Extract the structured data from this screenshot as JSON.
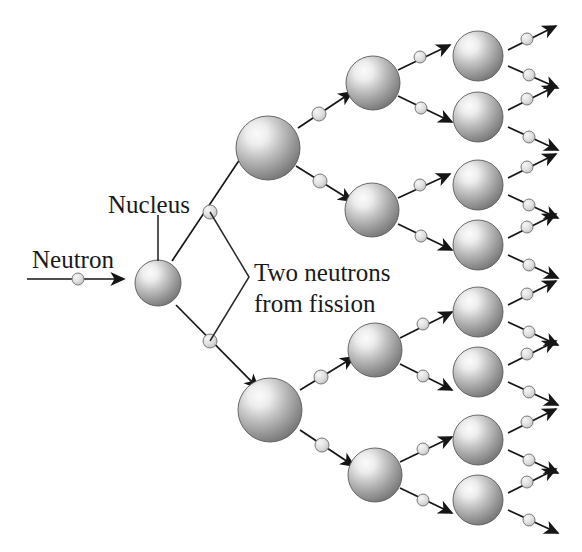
{
  "diagram": {
    "background_color": "#ffffff",
    "width": 582,
    "height": 552,
    "labels": {
      "neutron": "Neutron",
      "nucleus": "Nucleus",
      "two_neutrons_line1": "Two neutrons",
      "two_neutrons_line2": "from fission"
    },
    "colors": {
      "ink": "#1a1a1a",
      "sphere_light": "#f2f2f2",
      "sphere_mid": "#9d9d9d",
      "sphere_dark": "#6b6b6b",
      "sphere_edge": "#5a5a5a",
      "neutron_fill": "#dcdcdc",
      "neutron_stroke": "#7a7a7a",
      "arrow": "#161616",
      "leader_line": "#2a2a2a"
    },
    "generations": [
      {
        "index": 1,
        "name": "initial-nucleus",
        "sphere_radius": 23,
        "nuclei": [
          {
            "cx": 158,
            "cy": 283
          }
        ]
      },
      {
        "index": 2,
        "name": "second-generation",
        "sphere_radius": 32,
        "nuclei": [
          {
            "cx": 268,
            "cy": 148
          },
          {
            "cx": 270,
            "cy": 410
          }
        ]
      },
      {
        "index": 3,
        "name": "third-generation",
        "sphere_radius": 27,
        "nuclei": [
          {
            "cx": 373,
            "cy": 83
          },
          {
            "cx": 372,
            "cy": 210
          },
          {
            "cx": 375,
            "cy": 350
          },
          {
            "cx": 375,
            "cy": 475
          }
        ]
      },
      {
        "index": 4,
        "name": "fourth-generation",
        "sphere_radius": 25,
        "nuclei": [
          {
            "cx": 478,
            "cy": 56
          },
          {
            "cx": 478,
            "cy": 117
          },
          {
            "cx": 478,
            "cy": 185
          },
          {
            "cx": 478,
            "cy": 245
          },
          {
            "cx": 478,
            "cy": 312
          },
          {
            "cx": 478,
            "cy": 372
          },
          {
            "cx": 478,
            "cy": 440
          },
          {
            "cx": 478,
            "cy": 500
          }
        ]
      }
    ],
    "incoming_neutron": {
      "name": "incoming-neutron",
      "x1": 27,
      "y1": 279,
      "x2": 124,
      "y2": 279,
      "neutron_cx": 78,
      "neutron_cy": 279,
      "neutron_r": 6
    },
    "nucleus_leader": {
      "x1": 158,
      "y1": 215,
      "x2": 158,
      "y2": 261
    },
    "neutron_label_pos": {
      "x": 32,
      "y": 268
    },
    "nucleus_label_pos": {
      "x": 108,
      "y": 213
    },
    "two_neutrons_label_pos": {
      "x": 254,
      "y": 281
    },
    "callout_bracket": {
      "apex_x": 249,
      "apex_y": 277,
      "top_x": 210,
      "top_y": 212,
      "bottom_x": 210,
      "bottom_y": 341
    },
    "emitted_neutrons": [
      {
        "from": "gen1",
        "x1": 172,
        "y1": 261,
        "x2": 262,
        "y2": 126,
        "nx": 210,
        "ny": 212,
        "r": 7,
        "arrow": true
      },
      {
        "from": "gen1",
        "x1": 176,
        "y1": 305,
        "x2": 258,
        "y2": 388,
        "nx": 210,
        "ny": 341,
        "r": 7,
        "arrow": true
      },
      {
        "from": "gen2a",
        "x1": 298,
        "y1": 128,
        "x2": 352,
        "y2": 92,
        "nx": 319,
        "ny": 114,
        "r": 7,
        "arrow": true
      },
      {
        "from": "gen2a",
        "x1": 296,
        "y1": 166,
        "x2": 352,
        "y2": 201,
        "nx": 320,
        "ny": 181,
        "r": 7,
        "arrow": true
      },
      {
        "from": "gen2b",
        "x1": 300,
        "y1": 390,
        "x2": 354,
        "y2": 357,
        "nx": 321,
        "ny": 377,
        "r": 7,
        "arrow": true
      },
      {
        "from": "gen2b",
        "x1": 300,
        "y1": 430,
        "x2": 354,
        "y2": 466,
        "nx": 322,
        "ny": 445,
        "r": 7,
        "arrow": true
      },
      {
        "from": "gen3a",
        "x1": 398,
        "y1": 70,
        "x2": 450,
        "y2": 45,
        "nx": 420,
        "ny": 57,
        "r": 6,
        "arrow": true
      },
      {
        "from": "gen3a",
        "x1": 398,
        "y1": 96,
        "x2": 452,
        "y2": 122,
        "nx": 421,
        "ny": 108,
        "r": 6,
        "arrow": true
      },
      {
        "from": "gen3b",
        "x1": 398,
        "y1": 198,
        "x2": 450,
        "y2": 174,
        "nx": 420,
        "ny": 185,
        "r": 6,
        "arrow": true
      },
      {
        "from": "gen3b",
        "x1": 398,
        "y1": 224,
        "x2": 452,
        "y2": 250,
        "nx": 421,
        "ny": 236,
        "r": 6,
        "arrow": true
      },
      {
        "from": "gen3c",
        "x1": 400,
        "y1": 338,
        "x2": 452,
        "y2": 312,
        "nx": 423,
        "ny": 324,
        "r": 6,
        "arrow": true
      },
      {
        "from": "gen3c",
        "x1": 400,
        "y1": 364,
        "x2": 452,
        "y2": 390,
        "nx": 423,
        "ny": 376,
        "r": 6,
        "arrow": true
      },
      {
        "from": "gen3d",
        "x1": 400,
        "y1": 462,
        "x2": 452,
        "y2": 437,
        "nx": 423,
        "ny": 449,
        "r": 6,
        "arrow": true
      },
      {
        "from": "gen3d",
        "x1": 400,
        "y1": 488,
        "x2": 452,
        "y2": 513,
        "nx": 423,
        "ny": 500,
        "r": 6,
        "arrow": true
      },
      {
        "from": "gen4-1",
        "x1": 508,
        "y1": 50,
        "x2": 556,
        "y2": 26,
        "nx": 527,
        "ny": 39,
        "r": 6,
        "arrow": true
      },
      {
        "from": "gen4-1",
        "x1": 508,
        "y1": 66,
        "x2": 558,
        "y2": 88,
        "nx": 529,
        "ny": 75,
        "r": 6,
        "arrow": true
      },
      {
        "from": "gen4-2",
        "x1": 508,
        "y1": 110,
        "x2": 556,
        "y2": 86,
        "nx": 527,
        "ny": 99,
        "r": 6,
        "arrow": true
      },
      {
        "from": "gen4-2",
        "x1": 508,
        "y1": 127,
        "x2": 558,
        "y2": 150,
        "nx": 529,
        "ny": 137,
        "r": 6,
        "arrow": true
      },
      {
        "from": "gen4-3",
        "x1": 508,
        "y1": 178,
        "x2": 556,
        "y2": 154,
        "nx": 527,
        "ny": 167,
        "r": 6,
        "arrow": true
      },
      {
        "from": "gen4-3",
        "x1": 508,
        "y1": 195,
        "x2": 558,
        "y2": 218,
        "nx": 529,
        "ny": 205,
        "r": 6,
        "arrow": true
      },
      {
        "from": "gen4-4",
        "x1": 508,
        "y1": 238,
        "x2": 556,
        "y2": 214,
        "nx": 527,
        "ny": 227,
        "r": 6,
        "arrow": true
      },
      {
        "from": "gen4-4",
        "x1": 508,
        "y1": 255,
        "x2": 558,
        "y2": 278,
        "nx": 529,
        "ny": 265,
        "r": 6,
        "arrow": true
      },
      {
        "from": "gen4-5",
        "x1": 508,
        "y1": 305,
        "x2": 556,
        "y2": 281,
        "nx": 527,
        "ny": 294,
        "r": 6,
        "arrow": true
      },
      {
        "from": "gen4-5",
        "x1": 508,
        "y1": 322,
        "x2": 558,
        "y2": 345,
        "nx": 529,
        "ny": 332,
        "r": 6,
        "arrow": true
      },
      {
        "from": "gen4-6",
        "x1": 508,
        "y1": 365,
        "x2": 556,
        "y2": 341,
        "nx": 527,
        "ny": 354,
        "r": 6,
        "arrow": true
      },
      {
        "from": "gen4-6",
        "x1": 508,
        "y1": 382,
        "x2": 558,
        "y2": 405,
        "nx": 529,
        "ny": 392,
        "r": 6,
        "arrow": true
      },
      {
        "from": "gen4-7",
        "x1": 508,
        "y1": 433,
        "x2": 556,
        "y2": 409,
        "nx": 527,
        "ny": 422,
        "r": 6,
        "arrow": true
      },
      {
        "from": "gen4-7",
        "x1": 508,
        "y1": 450,
        "x2": 558,
        "y2": 473,
        "nx": 529,
        "ny": 460,
        "r": 6,
        "arrow": true
      },
      {
        "from": "gen4-8",
        "x1": 508,
        "y1": 493,
        "x2": 556,
        "y2": 469,
        "nx": 527,
        "ny": 482,
        "r": 6,
        "arrow": true
      },
      {
        "from": "gen4-8",
        "x1": 508,
        "y1": 510,
        "x2": 558,
        "y2": 533,
        "nx": 529,
        "ny": 520,
        "r": 6,
        "arrow": true
      }
    ]
  }
}
